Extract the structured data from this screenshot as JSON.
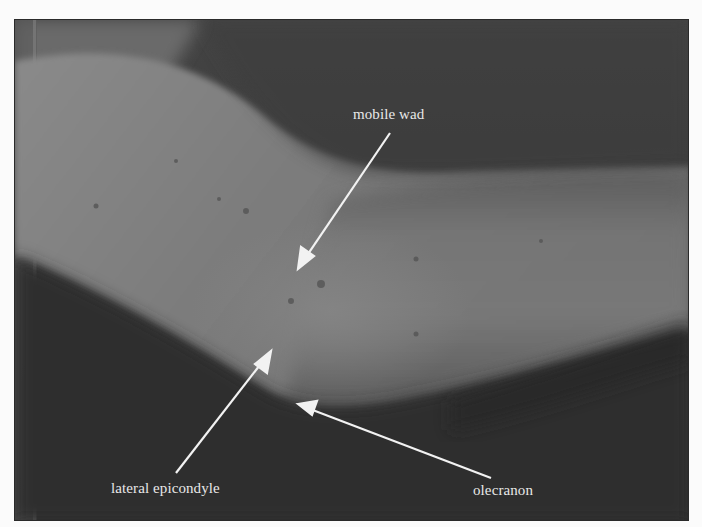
{
  "figure": {
    "annotations": [
      {
        "id": "mobile-wad",
        "label": "mobile wad",
        "arrow_from": [
          389,
          132
        ],
        "arrow_to": [
          297,
          268
        ]
      },
      {
        "id": "lateral-epicondyle",
        "label": "lateral epicondyle",
        "arrow_from": [
          175,
          472
        ],
        "arrow_to": [
          270,
          350
        ]
      },
      {
        "id": "olecranon",
        "label": "olecranon",
        "arrow_from": [
          490,
          477
        ],
        "arrow_to": [
          297,
          403
        ]
      }
    ]
  }
}
